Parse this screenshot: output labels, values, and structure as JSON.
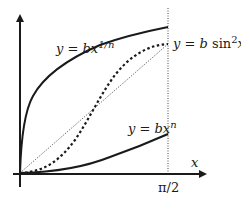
{
  "diagram": {
    "type": "function-plot",
    "axes": {
      "x_label": "x",
      "x_tick_label": "π/2",
      "y_label": ""
    },
    "curves": [
      {
        "id": "root",
        "label_pre": "y = ",
        "label_b": "bx",
        "label_sup": "1/n",
        "style": "solid"
      },
      {
        "id": "sine",
        "label_pre": "y = ",
        "label_b": "b",
        "label_mid": " sin",
        "label_sup": "2",
        "label_post": "x",
        "style": "dashed"
      },
      {
        "id": "power",
        "label_pre": "y = ",
        "label_b": "bx",
        "label_sup": "n",
        "style": "solid"
      },
      {
        "id": "linear",
        "style": "dotted"
      }
    ],
    "colors": {
      "ink": "#1a1a1a",
      "background": "#ffffff"
    }
  }
}
